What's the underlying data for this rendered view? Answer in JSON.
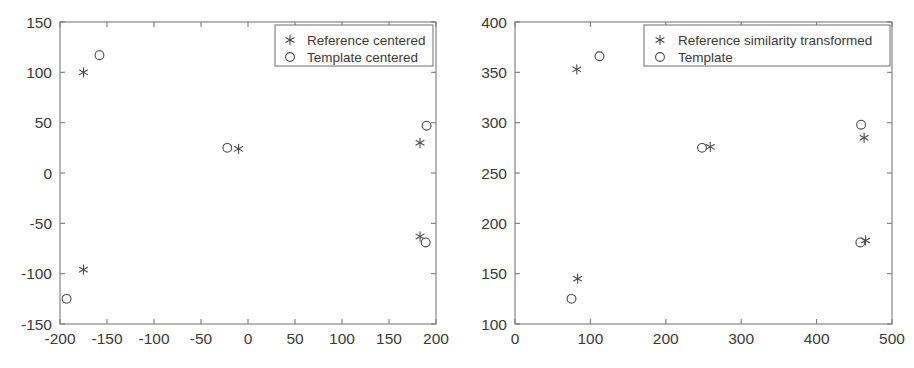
{
  "figure": {
    "background_color": "#ffffff",
    "axis_color": "#7a7a7a",
    "marker_color": "#4a4a4a",
    "text_color": "#3a3a3a",
    "panel_count": 2
  },
  "chart_data": [
    {
      "panel": "left",
      "type": "scatter",
      "title": "",
      "xlabel": "",
      "ylabel": "",
      "xlim": [
        -200,
        200
      ],
      "ylim": [
        -150,
        150
      ],
      "xticks": [
        -200,
        -150,
        -100,
        -50,
        0,
        50,
        100,
        150,
        200
      ],
      "yticks": [
        -150,
        -100,
        -50,
        0,
        50,
        100,
        150
      ],
      "xtick_labels": [
        "-200",
        "-150",
        "-100",
        "-50",
        "0",
        "50",
        "100",
        "150",
        "200"
      ],
      "ytick_labels": [
        "-150",
        "-100",
        "-50",
        "0",
        "50",
        "100",
        "150"
      ],
      "grid": false,
      "legend_position": "upper right",
      "series": [
        {
          "name": "Reference centered",
          "marker": "asterisk",
          "points": [
            {
              "x": -175,
              "y": 100
            },
            {
              "x": -10,
              "y": 24
            },
            {
              "x": 183,
              "y": 30
            },
            {
              "x": 183,
              "y": -63
            },
            {
              "x": -175,
              "y": -96
            }
          ]
        },
        {
          "name": "Template centered",
          "marker": "circle",
          "points": [
            {
              "x": -158,
              "y": 117
            },
            {
              "x": -22,
              "y": 25
            },
            {
              "x": 190,
              "y": 47
            },
            {
              "x": 189,
              "y": -69
            },
            {
              "x": -193,
              "y": -125
            }
          ]
        }
      ]
    },
    {
      "panel": "right",
      "type": "scatter",
      "title": "",
      "xlabel": "",
      "ylabel": "",
      "xlim": [
        0,
        500
      ],
      "ylim": [
        100,
        400
      ],
      "xticks": [
        0,
        100,
        200,
        300,
        400,
        500
      ],
      "yticks": [
        100,
        150,
        200,
        250,
        300,
        350,
        400
      ],
      "xtick_labels": [
        "0",
        "100",
        "200",
        "300",
        "400",
        "500"
      ],
      "ytick_labels": [
        "100",
        "150",
        "200",
        "250",
        "300",
        "350",
        "400"
      ],
      "grid": false,
      "legend_position": "upper right",
      "series": [
        {
          "name": "Reference similarity transformed",
          "marker": "asterisk",
          "points": [
            {
              "x": 82,
              "y": 353
            },
            {
              "x": 259,
              "y": 276
            },
            {
              "x": 463,
              "y": 285
            },
            {
              "x": 465,
              "y": 183
            },
            {
              "x": 83,
              "y": 145
            }
          ]
        },
        {
          "name": "Template",
          "marker": "circle",
          "points": [
            {
              "x": 112,
              "y": 366
            },
            {
              "x": 248,
              "y": 275
            },
            {
              "x": 459,
              "y": 298
            },
            {
              "x": 458,
              "y": 181
            },
            {
              "x": 75,
              "y": 125
            }
          ]
        }
      ]
    }
  ]
}
